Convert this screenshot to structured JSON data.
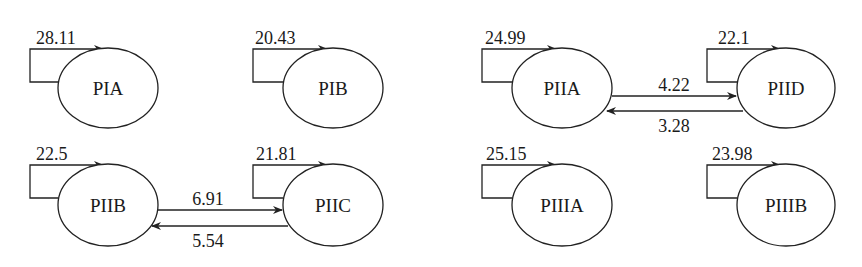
{
  "title": "",
  "nodes": [
    {
      "id": "PIA",
      "label": "PIA",
      "cx": 108,
      "cy": 88,
      "self_loop": "28.11"
    },
    {
      "id": "PIB",
      "label": "PIB",
      "cx": 333,
      "cy": 88,
      "self_loop": "20.43"
    },
    {
      "id": "PIIA",
      "label": "PIIA",
      "cx": 562,
      "cy": 88,
      "self_loop": "24.99"
    },
    {
      "id": "PIID",
      "label": "PIID",
      "cx": 786,
      "cy": 88,
      "self_loop": "22.1"
    },
    {
      "id": "PIIB",
      "label": "PIIB",
      "cx": 108,
      "cy": 205,
      "self_loop": "22.5"
    },
    {
      "id": "PIIC",
      "label": "PIIC",
      "cx": 333,
      "cy": 205,
      "self_loop": "21.81"
    },
    {
      "id": "PIIIA",
      "label": "PIIIA",
      "cx": 562,
      "cy": 205,
      "self_loop": "25.15"
    },
    {
      "id": "PIIIB",
      "label": "PIIIB",
      "cx": 786,
      "cy": 205,
      "self_loop": "23.98"
    }
  ],
  "edges": [
    {
      "from": "PIIA",
      "to": "PIID",
      "label": "4.22"
    },
    {
      "from": "PIID",
      "to": "PIIA",
      "label": "3.28"
    },
    {
      "from": "PIIB",
      "to": "PIIC",
      "label": "6.91"
    },
    {
      "from": "PIIC",
      "to": "PIIB",
      "label": "5.54"
    }
  ],
  "style": {
    "stroke": "#222222",
    "text": "#1a1a1a",
    "background": "#ffffff"
  }
}
